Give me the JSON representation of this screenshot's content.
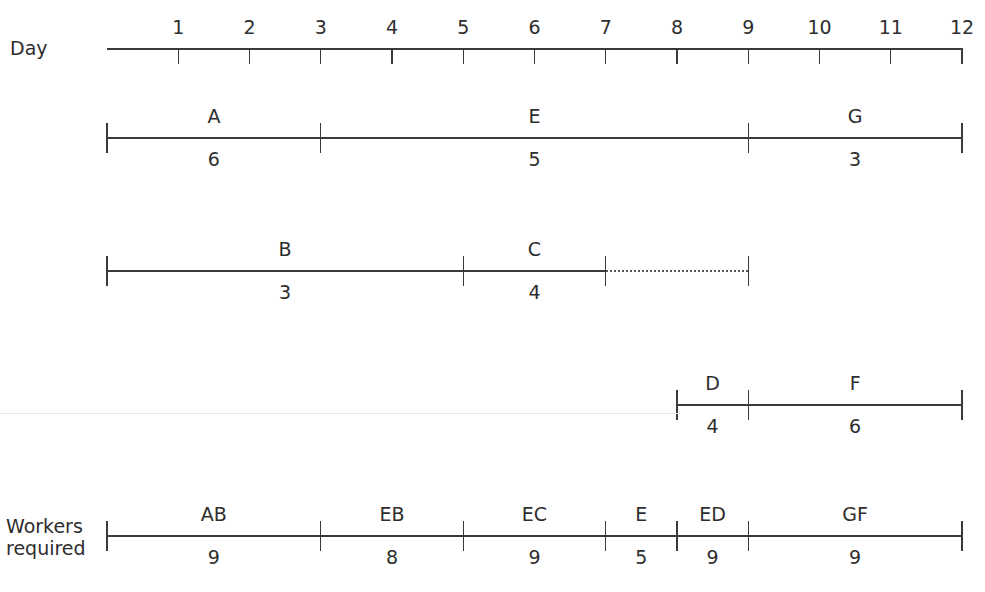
{
  "diagram": {
    "axis": {
      "label": "Day",
      "ticks": [
        "1",
        "2",
        "3",
        "4",
        "5",
        "6",
        "7",
        "8",
        "9",
        "10",
        "11",
        "12"
      ]
    },
    "rows": [
      {
        "id": "row-1",
        "activities": [
          {
            "name": "A",
            "value": "6",
            "start": 0,
            "end": 3
          },
          {
            "name": "E",
            "value": "5",
            "start": 3,
            "end": 9
          },
          {
            "name": "G",
            "value": "3",
            "start": 9,
            "end": 12
          }
        ]
      },
      {
        "id": "row-2",
        "activities": [
          {
            "name": "B",
            "value": "3",
            "start": 0,
            "end": 5
          },
          {
            "name": "C",
            "value": "4",
            "start": 5,
            "end": 7
          }
        ],
        "float": {
          "start": 7,
          "end": 9,
          "style": "dotted"
        }
      },
      {
        "id": "row-3",
        "activities": [
          {
            "name": "D",
            "value": "4",
            "start": 8,
            "end": 9
          },
          {
            "name": "F",
            "value": "6",
            "start": 9,
            "end": 12
          }
        ]
      }
    ],
    "workers": {
      "label_line1": "Workers",
      "label_line2": "required",
      "segments": [
        {
          "name": "AB",
          "value": "9",
          "start": 0,
          "end": 3
        },
        {
          "name": "EB",
          "value": "8",
          "start": 3,
          "end": 5
        },
        {
          "name": "EC",
          "value": "9",
          "start": 5,
          "end": 7
        },
        {
          "name": "E",
          "value": "5",
          "start": 7,
          "end": 8
        },
        {
          "name": "ED",
          "value": "9",
          "start": 8,
          "end": 9
        },
        {
          "name": "GF",
          "value": "9",
          "start": 9,
          "end": 12
        }
      ]
    }
  },
  "chart_data": {
    "type": "gantt",
    "title": "",
    "xlabel": "Day",
    "x_ticks": [
      1,
      2,
      3,
      4,
      5,
      6,
      7,
      8,
      9,
      10,
      11,
      12
    ],
    "xlim": [
      0,
      12
    ],
    "activities": [
      {
        "activity": "A",
        "workers": 6,
        "start": 0,
        "end": 3,
        "row": 1
      },
      {
        "activity": "E",
        "workers": 5,
        "start": 3,
        "end": 9,
        "row": 1
      },
      {
        "activity": "G",
        "workers": 3,
        "start": 9,
        "end": 12,
        "row": 1
      },
      {
        "activity": "B",
        "workers": 3,
        "start": 0,
        "end": 5,
        "row": 2
      },
      {
        "activity": "C",
        "workers": 4,
        "start": 5,
        "end": 7,
        "row": 2,
        "float_until": 9
      },
      {
        "activity": "D",
        "workers": 4,
        "start": 8,
        "end": 9,
        "row": 3
      },
      {
        "activity": "F",
        "workers": 6,
        "start": 9,
        "end": 12,
        "row": 3
      }
    ],
    "workers_required": [
      {
        "label": "AB",
        "value": 9,
        "start": 0,
        "end": 3
      },
      {
        "label": "EB",
        "value": 8,
        "start": 3,
        "end": 5
      },
      {
        "label": "EC",
        "value": 9,
        "start": 5,
        "end": 7
      },
      {
        "label": "E",
        "value": 5,
        "start": 7,
        "end": 8
      },
      {
        "label": "ED",
        "value": 9,
        "start": 8,
        "end": 9
      },
      {
        "label": "GF",
        "value": 9,
        "start": 9,
        "end": 12
      }
    ]
  }
}
